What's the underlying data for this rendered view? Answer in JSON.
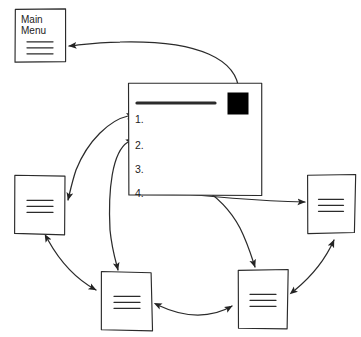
{
  "diagram": {
    "style": {
      "stroke": "#2b2b2b",
      "fill": "#ffffff",
      "accent_fill": "#000000",
      "background": "#ffffff"
    },
    "nodes": [
      {
        "id": "main-menu",
        "name": "main-menu-page",
        "label": "Main\nMenu",
        "x": 15,
        "y": 9,
        "width": 50,
        "height": 53,
        "text_lines": 3,
        "has_label": true
      },
      {
        "id": "left-page",
        "name": "left-page",
        "label": "",
        "x": 15,
        "y": 176,
        "width": 50,
        "height": 58,
        "text_lines": 3,
        "has_label": false
      },
      {
        "id": "right-page",
        "name": "right-page",
        "label": "",
        "x": 307,
        "y": 175,
        "width": 48,
        "height": 58,
        "text_lines": 3,
        "has_label": false
      },
      {
        "id": "bottom-left-page",
        "name": "bottom-left-page",
        "label": "",
        "x": 102,
        "y": 272,
        "width": 50,
        "height": 58,
        "text_lines": 3,
        "has_label": false
      },
      {
        "id": "bottom-right-page",
        "name": "bottom-right-page",
        "label": "",
        "x": 238,
        "y": 270,
        "width": 50,
        "height": 58,
        "text_lines": 3,
        "has_label": false
      }
    ],
    "main_screen": {
      "name": "main-content-screen",
      "x": 129,
      "y": 84,
      "width": 133,
      "height": 111,
      "header_rule": {
        "name": "header-rule",
        "x1": 137,
        "y1": 103,
        "x2": 215,
        "y2": 103
      },
      "accent_square": {
        "name": "accent-square",
        "x": 228,
        "y": 93,
        "width": 20,
        "height": 21,
        "color": "#000000"
      },
      "list_items": [
        {
          "label": "1.",
          "x": 135,
          "y": 113
        },
        {
          "label": "2.",
          "x": 135,
          "y": 139
        },
        {
          "label": "3.",
          "x": 135,
          "y": 163
        },
        {
          "label": "4.",
          "x": 135,
          "y": 187
        }
      ]
    },
    "connectors": [
      {
        "name": "connector-accent-square-to-main-menu",
        "from": "accent-square",
        "to": "main-menu",
        "arrowheads": "end",
        "path": "M 239 92 C 238 60, 200 40, 120 42 C 95 42, 80 45, 69 46"
      },
      {
        "name": "connector-item1-to-left-page",
        "from": "list-item-1",
        "to": "left-page",
        "arrowheads": "both",
        "path": "M 128 116 C 110 120, 88 140, 76 170 C 72 182, 70 192, 68 200"
      },
      {
        "name": "connector-item2-to-bottom-left-page",
        "from": "list-item-2",
        "to": "bottom-left-page",
        "arrowheads": "both",
        "path": "M 128 142 C 112 152, 108 190, 110 230 C 112 250, 116 262, 118 270"
      },
      {
        "name": "connector-item3-to-bottom-right-page",
        "from": "list-item-3",
        "to": "bottom-right-page",
        "arrowheads": "both",
        "path": "M 148 166 C 180 172, 220 190, 240 228 C 248 244, 252 258, 255 267"
      },
      {
        "name": "connector-item4-to-right-page",
        "from": "list-item-4",
        "to": "right-page",
        "arrowheads": "both",
        "path": "M 149 190 C 200 196, 260 201, 305 202"
      },
      {
        "name": "connector-left-page-to-bottom-left-page",
        "from": "left-page",
        "to": "bottom-left-page",
        "arrowheads": "both",
        "path": "M 48 240 C 58 258, 74 278, 96 290"
      },
      {
        "name": "connector-bottom-left-to-bottom-right",
        "from": "bottom-left-page",
        "to": "bottom-right-page",
        "arrowheads": "both",
        "path": "M 160 306 C 185 318, 212 318, 232 306"
      },
      {
        "name": "connector-bottom-right-to-right-page",
        "from": "bottom-right-page",
        "to": "right-page",
        "arrowheads": "both",
        "path": "M 295 290 C 312 276, 326 258, 334 240"
      }
    ]
  }
}
